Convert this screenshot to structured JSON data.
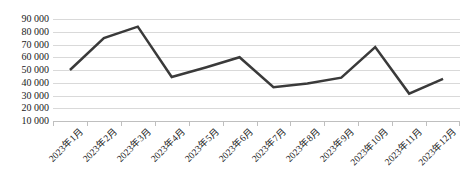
{
  "chart_data": {
    "type": "line",
    "title": "",
    "xlabel": "",
    "ylabel": "",
    "categories": [
      "2023年1月",
      "2023年2月",
      "2023年3月",
      "2023年4月",
      "2023年5月",
      "2023年6月",
      "2023年7月",
      "2023年8月",
      "2023年9月",
      "2023年10月",
      "2023年11月",
      "2023年12月"
    ],
    "values": [
      50000,
      75000,
      84000,
      44500,
      52000,
      60000,
      36500,
      39500,
      44000,
      68000,
      31500,
      43000
    ],
    "series": [
      {
        "name": "",
        "values": [
          50000,
          75000,
          84000,
          44500,
          52000,
          60000,
          36500,
          39500,
          44000,
          68000,
          31500,
          43000
        ]
      }
    ],
    "ylim": [
      10000,
      90000
    ],
    "ytick_values": [
      90000,
      80000,
      70000,
      60000,
      50000,
      40000,
      30000,
      20000,
      10000
    ],
    "ytick_labels": [
      "90 000",
      "80 000",
      "70 000",
      "60 000",
      "50 000",
      "40 000",
      "30 000",
      "20 000",
      "10 000"
    ],
    "grid": true,
    "legend": "none",
    "colors": {
      "line": "#3a3a3a",
      "gridline": "#d9d9d9",
      "axis": "#bfbfbf",
      "text": "#1a1a1a",
      "background": "#ffffff"
    },
    "line_width": 2.5,
    "markers": "none"
  }
}
